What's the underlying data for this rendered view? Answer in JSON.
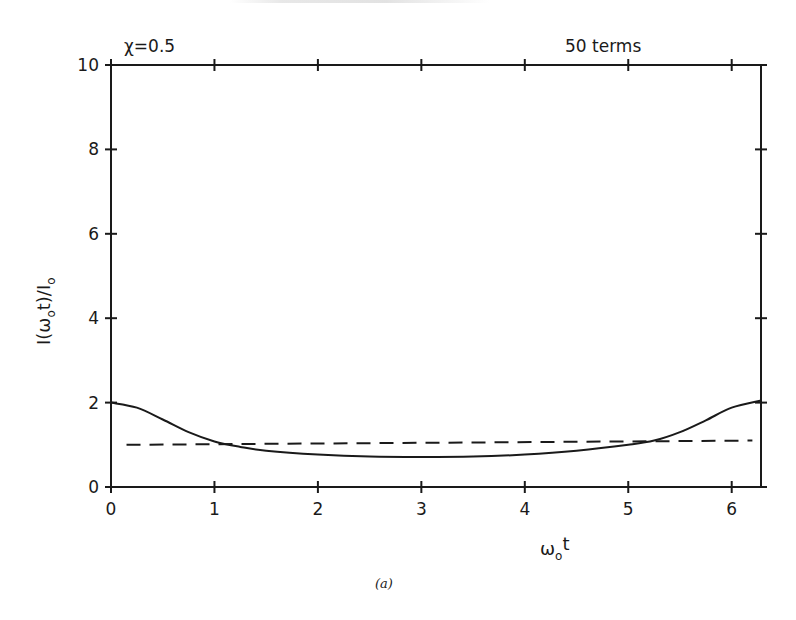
{
  "chart_data": {
    "type": "line",
    "title": "",
    "annotations": {
      "left": "χ=0.5",
      "right": "50 terms"
    },
    "xlabel": "ω_o t",
    "xlabel_parts": {
      "main": "ω",
      "sub": "o",
      "tail": "t"
    },
    "ylabel": "I(ω_o t)/I_o",
    "ylabel_parts": {
      "a": "I(ω",
      "sub1": "o",
      "b": "t)/I",
      "sub2": "o"
    },
    "caption": "(a)",
    "xlim": [
      0,
      6.2832
    ],
    "ylim": [
      0,
      10
    ],
    "x_ticks": [
      0,
      1,
      2,
      3,
      4,
      5,
      6
    ],
    "x_tick_labels": [
      "0",
      "1",
      "2",
      "3",
      "4",
      "5",
      "6"
    ],
    "y_ticks": [
      0,
      2,
      4,
      6,
      8,
      10
    ],
    "y_tick_labels": [
      "0",
      "2",
      "4",
      "6",
      "8",
      "10"
    ],
    "grid": false,
    "frame": "box with ticks on all sides",
    "series": [
      {
        "name": "series (solid)",
        "style": "solid",
        "x": [
          0,
          0.25,
          0.5,
          0.75,
          1.0,
          1.25,
          1.5,
          2.0,
          2.5,
          3.0,
          3.5,
          4.0,
          4.5,
          5.0,
          5.25,
          5.5,
          5.75,
          6.0,
          6.2832
        ],
        "y": [
          2.0,
          1.88,
          1.6,
          1.3,
          1.08,
          0.95,
          0.86,
          0.77,
          0.72,
          0.71,
          0.72,
          0.77,
          0.86,
          1.0,
          1.1,
          1.3,
          1.58,
          1.88,
          2.05
        ]
      },
      {
        "name": "series (dashed)",
        "style": "dashed",
        "x": [
          0.15,
          6.2
        ],
        "y": [
          1.0,
          1.1
        ]
      }
    ]
  }
}
